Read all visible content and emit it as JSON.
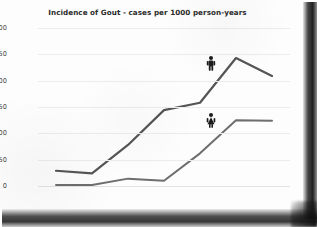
{
  "chart_data": {
    "type": "line",
    "title": "Incidence of Gout - cases per 1000 person-years",
    "xlabel": "",
    "ylabel": "",
    "categories": [
      "18-29",
      "30-39",
      "40-49",
      "50-59",
      "60-69",
      "70-79",
      "80+"
    ],
    "series": [
      {
        "name": "Men",
        "icon": "male-figure-icon",
        "color": "#555555",
        "values": [
          29,
          24,
          78,
          144,
          158,
          243,
          209
        ],
        "label_at_category": "70-79"
      },
      {
        "name": "Women",
        "icon": "female-figure-icon",
        "color": "#6e6e6e",
        "values": [
          2,
          2,
          14,
          10,
          62,
          125,
          124
        ],
        "label_at_category": "70-79"
      }
    ],
    "ylim": [
      0,
      300
    ],
    "yticks": [
      0,
      50,
      100,
      150,
      200,
      250,
      300
    ],
    "ytick_labels": [
      "0",
      "50",
      "100",
      "150",
      "200",
      "250",
      "300"
    ],
    "grid": true,
    "grid_orientation": "horizontal",
    "legend": "inline-icons",
    "legend_position": "inline"
  },
  "figure": {
    "background_color": "#ffffff",
    "card_color": "#fdfdfd",
    "axis_text_color": "#4a4a4a",
    "title_color": "#2c2c2c",
    "gridline_color": "#ececed",
    "shadow_note": "scan-shadow-right-and-bottom"
  }
}
